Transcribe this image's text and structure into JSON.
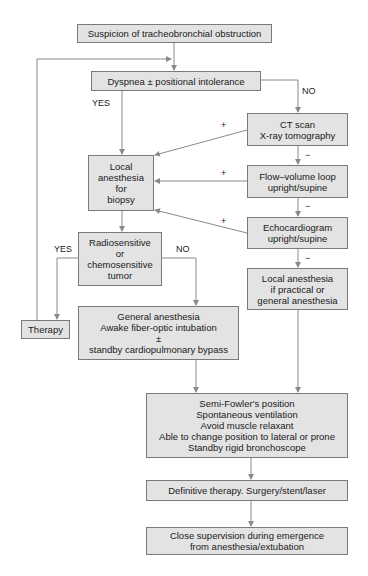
{
  "diagram": {
    "type": "flowchart",
    "colors": {
      "box_fill": "#e3e3e3",
      "box_border": "#7a7a7a",
      "line": "#8a8a8a",
      "text": "#1a1a1a"
    },
    "nodes": {
      "suspicion": {
        "lines": [
          "Suspicion of tracheobronchial obstruction"
        ]
      },
      "dyspnea": {
        "lines": [
          "Dyspnea ± positional intolerance"
        ]
      },
      "ct_scan": {
        "lines": [
          "CT scan",
          "X-ray tomography"
        ]
      },
      "local_biopsy": {
        "lines": [
          "Local",
          "anesthesia",
          "for",
          "biopsy"
        ]
      },
      "flow_volume": {
        "lines": [
          "Flow–volume loop",
          "upright/supine"
        ]
      },
      "echo": {
        "lines": [
          "Echocardiogram",
          "upright/supine"
        ]
      },
      "radiosensitive": {
        "lines": [
          "Radiosensitive",
          "or",
          "chemosensitive",
          "tumor"
        ]
      },
      "local_practical": {
        "lines": [
          "Local anesthesia",
          "if practical or",
          "general anesthesia"
        ]
      },
      "therapy": {
        "lines": [
          "Therapy"
        ]
      },
      "general_anesthesia": {
        "lines": [
          "General anesthesia",
          "Awake fiber-optic intubation",
          "±",
          "standby cardiopulmonary bypass"
        ]
      },
      "semi_fowler": {
        "lines": [
          "Semi-Fowler's position",
          "Spontaneous ventilation",
          "Avoid muscle relaxant",
          "Able to change position to lateral or prone",
          "Standby rigid bronchoscope"
        ]
      },
      "definitive": {
        "lines": [
          "Definitive therapy. Surgery/stent/laser"
        ]
      },
      "close_supervision": {
        "lines": [
          "Close supervision during emergence",
          "from anesthesia/extubation"
        ]
      }
    },
    "edge_labels": {
      "dyspnea_yes": "YES",
      "dyspnea_no": "NO",
      "ct_plus": "+",
      "ct_minus": "−",
      "flow_plus": "+",
      "flow_minus": "−",
      "echo_plus": "+",
      "echo_minus": "−",
      "radio_yes": "YES",
      "radio_no": "NO"
    }
  }
}
